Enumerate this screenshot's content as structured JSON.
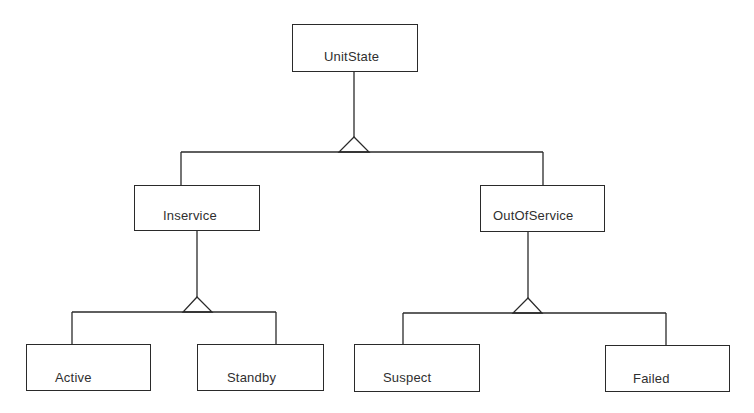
{
  "diagram": {
    "type": "generalization-hierarchy",
    "colors": {
      "background": "#ffffff",
      "line": "#2a2a2a",
      "text": "#2f2f2f"
    },
    "nodes": {
      "root": {
        "label": "UnitState"
      },
      "inservice": {
        "label": "Inservice"
      },
      "outofservice": {
        "label": "OutOfService"
      },
      "active": {
        "label": "Active"
      },
      "standby": {
        "label": "Standby"
      },
      "suspect": {
        "label": "Suspect"
      },
      "failed": {
        "label": "Failed"
      }
    },
    "relations": [
      {
        "parent": "UnitState",
        "children": [
          "Inservice",
          "OutOfService"
        ],
        "kind": "generalization"
      },
      {
        "parent": "Inservice",
        "children": [
          "Active",
          "Standby"
        ],
        "kind": "generalization"
      },
      {
        "parent": "OutOfService",
        "children": [
          "Suspect",
          "Failed"
        ],
        "kind": "generalization"
      }
    ]
  }
}
